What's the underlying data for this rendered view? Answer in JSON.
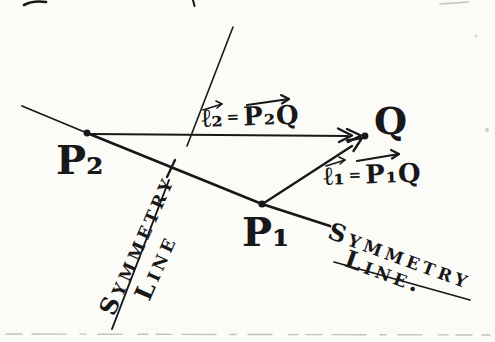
{
  "figure": {
    "points": {
      "q": "Q",
      "p1": "P₁",
      "p2": "P₂"
    },
    "equations": {
      "l2": {
        "lhs": "ℓ₂",
        "eq": "=",
        "rhs": "P₂Q"
      },
      "l1": {
        "lhs": "ℓ₁",
        "eq": "=",
        "rhs": "P₁Q"
      }
    },
    "symmetry_left": {
      "word1": "Symmetry",
      "word2": "Line"
    },
    "symmetry_right": {
      "word1": "Symmetry",
      "word2": "Line."
    }
  },
  "colors": {
    "ink": "#181818",
    "paper": "#fbfbf8",
    "faint": "#c3c3bc"
  }
}
